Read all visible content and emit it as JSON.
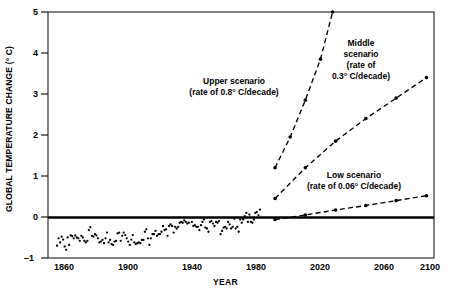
{
  "chart_data": {
    "type": "scatter",
    "title": "",
    "xlabel": "YEAR",
    "ylabel": "GLOBAL TEMPERATURE CHANGE (° C)",
    "xlim": [
      1850,
      2105
    ],
    "ylim": [
      -1,
      5
    ],
    "xticks": [
      1860,
      1900,
      1940,
      1980,
      2020,
      2060,
      2100
    ],
    "yticks": [
      -1,
      0,
      1,
      2,
      3,
      4,
      5
    ],
    "ytick_labels": [
      "–1",
      "0",
      "1",
      "2",
      "3",
      "4",
      "5"
    ],
    "grid": false,
    "legend_position": "inline-annotations",
    "zero_reference_line": 0,
    "series": [
      {
        "name": "Observed global temperature change",
        "type": "scatter",
        "marker": "dot",
        "points": [
          [
            1856,
            -0.7
          ],
          [
            1857,
            -0.52
          ],
          [
            1858,
            -0.62
          ],
          [
            1859,
            -0.48
          ],
          [
            1860,
            -0.55
          ],
          [
            1861,
            -0.72
          ],
          [
            1862,
            -0.8
          ],
          [
            1863,
            -0.5
          ],
          [
            1864,
            -0.68
          ],
          [
            1865,
            -0.45
          ],
          [
            1866,
            -0.47
          ],
          [
            1867,
            -0.52
          ],
          [
            1868,
            -0.45
          ],
          [
            1869,
            -0.5
          ],
          [
            1870,
            -0.52
          ],
          [
            1871,
            -0.58
          ],
          [
            1872,
            -0.46
          ],
          [
            1873,
            -0.5
          ],
          [
            1874,
            -0.58
          ],
          [
            1875,
            -0.62
          ],
          [
            1876,
            -0.58
          ],
          [
            1877,
            -0.32
          ],
          [
            1878,
            -0.25
          ],
          [
            1879,
            -0.46
          ],
          [
            1880,
            -0.48
          ],
          [
            1881,
            -0.42
          ],
          [
            1882,
            -0.45
          ],
          [
            1883,
            -0.52
          ],
          [
            1884,
            -0.62
          ],
          [
            1885,
            -0.6
          ],
          [
            1886,
            -0.56
          ],
          [
            1887,
            -0.64
          ],
          [
            1888,
            -0.52
          ],
          [
            1889,
            -0.38
          ],
          [
            1890,
            -0.62
          ],
          [
            1891,
            -0.56
          ],
          [
            1892,
            -0.66
          ],
          [
            1893,
            -0.68
          ],
          [
            1894,
            -0.6
          ],
          [
            1895,
            -0.58
          ],
          [
            1896,
            -0.4
          ],
          [
            1897,
            -0.38
          ],
          [
            1898,
            -0.58
          ],
          [
            1899,
            -0.46
          ],
          [
            1900,
            -0.38
          ],
          [
            1901,
            -0.44
          ],
          [
            1902,
            -0.52
          ],
          [
            1903,
            -0.6
          ],
          [
            1904,
            -0.68
          ],
          [
            1905,
            -0.55
          ],
          [
            1906,
            -0.44
          ],
          [
            1907,
            -0.62
          ],
          [
            1908,
            -0.66
          ],
          [
            1909,
            -0.64
          ],
          [
            1910,
            -0.62
          ],
          [
            1911,
            -0.64
          ],
          [
            1912,
            -0.56
          ],
          [
            1913,
            -0.56
          ],
          [
            1914,
            -0.36
          ],
          [
            1915,
            -0.3
          ],
          [
            1916,
            -0.52
          ],
          [
            1917,
            -0.68
          ],
          [
            1918,
            -0.52
          ],
          [
            1919,
            -0.42
          ],
          [
            1920,
            -0.42
          ],
          [
            1921,
            -0.34
          ],
          [
            1922,
            -0.46
          ],
          [
            1923,
            -0.42
          ],
          [
            1924,
            -0.42
          ],
          [
            1925,
            -0.36
          ],
          [
            1926,
            -0.22
          ],
          [
            1927,
            -0.32
          ],
          [
            1928,
            -0.3
          ],
          [
            1929,
            -0.46
          ],
          [
            1930,
            -0.22
          ],
          [
            1931,
            -0.18
          ],
          [
            1932,
            -0.22
          ],
          [
            1933,
            -0.38
          ],
          [
            1934,
            -0.24
          ],
          [
            1935,
            -0.28
          ],
          [
            1936,
            -0.24
          ],
          [
            1937,
            -0.14
          ],
          [
            1938,
            -0.12
          ],
          [
            1939,
            -0.14
          ],
          [
            1940,
            -0.08
          ],
          [
            1941,
            -0.12
          ],
          [
            1942,
            -0.16
          ],
          [
            1943,
            -0.14
          ],
          [
            1944,
            -0.02
          ],
          [
            1945,
            -0.12
          ],
          [
            1946,
            -0.22
          ],
          [
            1947,
            -0.2
          ],
          [
            1948,
            -0.24
          ],
          [
            1949,
            -0.24
          ],
          [
            1950,
            -0.32
          ],
          [
            1951,
            -0.2
          ],
          [
            1952,
            -0.12
          ],
          [
            1953,
            -0.06
          ],
          [
            1954,
            -0.26
          ],
          [
            1955,
            -0.28
          ],
          [
            1956,
            -0.36
          ],
          [
            1957,
            -0.12
          ],
          [
            1958,
            -0.1
          ],
          [
            1959,
            -0.16
          ],
          [
            1960,
            -0.22
          ],
          [
            1961,
            -0.12
          ],
          [
            1962,
            -0.14
          ],
          [
            1963,
            -0.1
          ],
          [
            1964,
            -0.42
          ],
          [
            1965,
            -0.34
          ],
          [
            1966,
            -0.26
          ],
          [
            1967,
            -0.24
          ],
          [
            1968,
            -0.28
          ],
          [
            1969,
            -0.12
          ],
          [
            1970,
            -0.18
          ],
          [
            1971,
            -0.28
          ],
          [
            1972,
            -0.24
          ],
          [
            1973,
            -0.04
          ],
          [
            1974,
            -0.28
          ],
          [
            1975,
            -0.24
          ],
          [
            1976,
            -0.36
          ],
          [
            1977,
            -0.06
          ],
          [
            1978,
            -0.14
          ],
          [
            1979,
            -0.06
          ],
          [
            1980,
            0.02
          ],
          [
            1981,
            0.1
          ],
          [
            1982,
            -0.12
          ],
          [
            1983,
            0.06
          ],
          [
            1984,
            -0.12
          ],
          [
            1985,
            -0.14
          ],
          [
            1986,
            -0.06
          ],
          [
            1987,
            0.1
          ],
          [
            1988,
            0.12
          ],
          [
            1989,
            0.04
          ],
          [
            1990,
            0.18
          ]
        ]
      },
      {
        "name": "Upper scenario",
        "type": "line",
        "style": "dashed",
        "marker": "dot",
        "rate_deg_c_per_decade": 0.8,
        "points": [
          [
            2000,
            1.2
          ],
          [
            2010,
            1.95
          ],
          [
            2020,
            2.85
          ],
          [
            2030,
            3.85
          ],
          [
            2038,
            5.0
          ]
        ]
      },
      {
        "name": "Middle scenario",
        "type": "line",
        "style": "dashed",
        "marker": "dot",
        "rate_deg_c_per_decade": 0.3,
        "points": [
          [
            2000,
            0.45
          ],
          [
            2020,
            1.2
          ],
          [
            2040,
            1.85
          ],
          [
            2060,
            2.4
          ],
          [
            2080,
            2.9
          ],
          [
            2100,
            3.4
          ]
        ]
      },
      {
        "name": "Low scenario",
        "type": "line",
        "style": "dashed",
        "marker": "dot",
        "rate_deg_c_per_decade": 0.06,
        "points": [
          [
            2000,
            -0.06
          ],
          [
            2020,
            0.05
          ],
          [
            2040,
            0.17
          ],
          [
            2060,
            0.28
          ],
          [
            2080,
            0.4
          ],
          [
            2100,
            0.52
          ]
        ]
      }
    ],
    "annotations": [
      {
        "id": "upper-scenario",
        "lines": [
          "Upper scenario",
          "(rate of 0.8° C/decade)"
        ],
        "x_px": 234,
        "y_px": 76
      },
      {
        "id": "middle-scenario",
        "lines": [
          "Middle",
          "scenario",
          "(rate of",
          "0.3° C/decade)"
        ],
        "x_px": 361,
        "y_px": 38
      },
      {
        "id": "low-scenario",
        "lines": [
          "Low scenario",
          "(rate of 0.06° C/decade)"
        ],
        "x_px": 348,
        "y_px": 170
      }
    ],
    "colors": {
      "axis": "#1a1a1a",
      "data": "#000000",
      "zero_line": "#000000",
      "background": "#ffffff"
    }
  },
  "axes": {
    "y_title": "GLOBAL TEMPERATURE CHANGE (° C)",
    "x_title": "YEAR",
    "y_tick_labels": [
      "5",
      "4",
      "3",
      "2",
      "1",
      "0",
      "–1"
    ],
    "x_tick_labels": [
      "1860",
      "1900",
      "1940",
      "1980",
      "2020",
      "2060",
      "2100"
    ]
  },
  "annotations": {
    "upper": {
      "line1": "Upper scenario",
      "line2": "(rate of 0.8° C/decade)"
    },
    "middle": {
      "line1": "Middle",
      "line2": "scenario",
      "line3": "(rate of",
      "line4": "0.3° C/decade)"
    },
    "low": {
      "line1": "Low scenario",
      "line2": "(rate of 0.06° C/decade)"
    }
  }
}
